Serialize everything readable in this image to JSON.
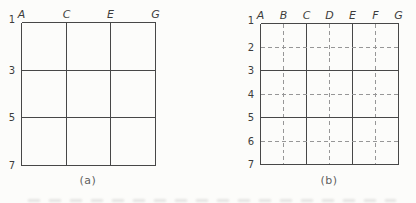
{
  "figure": {
    "panels": [
      {
        "caption": "(a)",
        "column_labels": [
          {
            "label": "A",
            "style": "solid"
          },
          {
            "label": "C",
            "style": "solid"
          },
          {
            "label": "E",
            "style": "solid"
          },
          {
            "label": "G",
            "style": "solid"
          }
        ],
        "row_labels": [
          {
            "label": "1",
            "style": "solid"
          },
          {
            "label": "3",
            "style": "solid"
          },
          {
            "label": "5",
            "style": "solid"
          },
          {
            "label": "7",
            "style": "solid"
          }
        ]
      },
      {
        "caption": "(b)",
        "column_labels": [
          {
            "label": "A",
            "style": "solid"
          },
          {
            "label": "B",
            "style": "dashed"
          },
          {
            "label": "C",
            "style": "solid"
          },
          {
            "label": "D",
            "style": "dashed"
          },
          {
            "label": "E",
            "style": "solid"
          },
          {
            "label": "F",
            "style": "dashed"
          },
          {
            "label": "G",
            "style": "solid"
          }
        ],
        "row_labels": [
          {
            "label": "1",
            "style": "solid"
          },
          {
            "label": "2",
            "style": "dashed"
          },
          {
            "label": "3",
            "style": "solid"
          },
          {
            "label": "4",
            "style": "dashed"
          },
          {
            "label": "5",
            "style": "solid"
          },
          {
            "label": "6",
            "style": "dashed"
          },
          {
            "label": "7",
            "style": "solid"
          }
        ]
      }
    ],
    "colors": {
      "background": "#fcfcfa",
      "solid_line": "#474747",
      "dashed_line": "#979797",
      "label_text": "#3c3c3c",
      "caption_text": "#5f5f5f"
    }
  }
}
